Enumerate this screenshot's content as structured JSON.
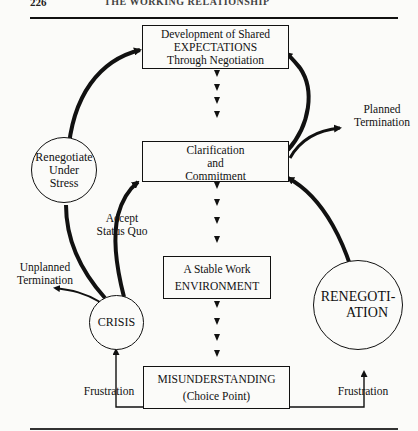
{
  "page": {
    "number": "226",
    "running_head": "THE WORKING RELATIONSHIP"
  },
  "nodes": {
    "expectations": {
      "lines": [
        "Development of Shared",
        "EXPECTATIONS",
        "Through Negotiation"
      ]
    },
    "clarification": {
      "lines": [
        "Clarification",
        "and",
        "Commitment"
      ]
    },
    "stable": {
      "lines": [
        "A Stable Work",
        "ENVIRONMENT"
      ]
    },
    "misunderstanding": {
      "lines": [
        "MISUNDERSTANDING",
        "(Choice Point)"
      ]
    },
    "renegotiate_stress": {
      "lines": [
        "Renegotiate",
        "Under",
        "Stress"
      ]
    },
    "crisis": {
      "lines": [
        "CRISIS"
      ]
    },
    "renegotiation": {
      "lines": [
        "RENEGOTI-",
        "ATION"
      ]
    }
  },
  "edge_labels": {
    "planned_termination": [
      "Planned",
      "Termination"
    ],
    "unplanned_termination": [
      "Unplanned",
      "Termination"
    ],
    "accept_status_quo": [
      "Accept",
      "Status Quo"
    ],
    "frustration_left": [
      "Frustration"
    ],
    "frustration_right": [
      "Frustration"
    ]
  }
}
